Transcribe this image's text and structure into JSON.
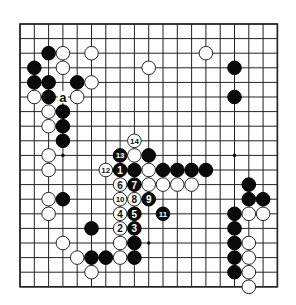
{
  "diagram": {
    "type": "go-board",
    "size": 19,
    "geometry": {
      "left": 20,
      "top": 24,
      "dx": 14.3,
      "dy": 14.6,
      "stone_radius": 6.8
    },
    "colors": {
      "background": "#ffffff",
      "line": "#222222",
      "black": "#0a0a0a",
      "white": "#ffffff"
    },
    "star_points": [
      [
        3,
        3
      ],
      [
        9,
        3
      ],
      [
        15,
        3
      ],
      [
        3,
        9
      ],
      [
        9,
        9
      ],
      [
        15,
        9
      ],
      [
        3,
        15
      ],
      [
        9,
        15
      ],
      [
        15,
        15
      ]
    ],
    "stones": [
      {
        "c": 2,
        "r": 2,
        "color": "black"
      },
      {
        "c": 3,
        "r": 2,
        "color": "white"
      },
      {
        "c": 5,
        "r": 2,
        "color": "white"
      },
      {
        "c": 13,
        "r": 2,
        "color": "white"
      },
      {
        "c": 1,
        "r": 3,
        "color": "black"
      },
      {
        "c": 3,
        "r": 3,
        "color": "white"
      },
      {
        "c": 9,
        "r": 3,
        "color": "white"
      },
      {
        "c": 15,
        "r": 3,
        "color": "black"
      },
      {
        "c": 1,
        "r": 4,
        "color": "black"
      },
      {
        "c": 2,
        "r": 4,
        "color": "black"
      },
      {
        "c": 4,
        "r": 4,
        "color": "black"
      },
      {
        "c": 5,
        "r": 4,
        "color": "white"
      },
      {
        "c": 1,
        "r": 5,
        "color": "white"
      },
      {
        "c": 2,
        "r": 5,
        "color": "black"
      },
      {
        "c": 4,
        "r": 5,
        "color": "white"
      },
      {
        "c": 15,
        "r": 5,
        "color": "black"
      },
      {
        "c": 2,
        "r": 6,
        "color": "white"
      },
      {
        "c": 3,
        "r": 6,
        "color": "black"
      },
      {
        "c": 2,
        "r": 7,
        "color": "white"
      },
      {
        "c": 3,
        "r": 7,
        "color": "black"
      },
      {
        "c": 3,
        "r": 8,
        "color": "black"
      },
      {
        "c": 2,
        "r": 9,
        "color": "white"
      },
      {
        "c": 8,
        "r": 9,
        "color": "white"
      },
      {
        "c": 9,
        "r": 9,
        "color": "black"
      },
      {
        "c": 2,
        "r": 10,
        "color": "white"
      },
      {
        "c": 8,
        "r": 10,
        "color": "black"
      },
      {
        "c": 9,
        "r": 10,
        "color": "white"
      },
      {
        "c": 10,
        "r": 10,
        "color": "black"
      },
      {
        "c": 11,
        "r": 10,
        "color": "black"
      },
      {
        "c": 12,
        "r": 10,
        "color": "black"
      },
      {
        "c": 13,
        "r": 10,
        "color": "black"
      },
      {
        "c": 9,
        "r": 11,
        "color": "white"
      },
      {
        "c": 10,
        "r": 11,
        "color": "white"
      },
      {
        "c": 11,
        "r": 11,
        "color": "white"
      },
      {
        "c": 12,
        "r": 11,
        "color": "white"
      },
      {
        "c": 16,
        "r": 11,
        "color": "black"
      },
      {
        "c": 2,
        "r": 12,
        "color": "white"
      },
      {
        "c": 3,
        "r": 12,
        "color": "black"
      },
      {
        "c": 16,
        "r": 12,
        "color": "black"
      },
      {
        "c": 17,
        "r": 12,
        "color": "black"
      },
      {
        "c": 2,
        "r": 13,
        "color": "white"
      },
      {
        "c": 15,
        "r": 13,
        "color": "black"
      },
      {
        "c": 16,
        "r": 13,
        "color": "white"
      },
      {
        "c": 17,
        "r": 13,
        "color": "white"
      },
      {
        "c": 5,
        "r": 14,
        "color": "black"
      },
      {
        "c": 15,
        "r": 14,
        "color": "black"
      },
      {
        "c": 3,
        "r": 15,
        "color": "white"
      },
      {
        "c": 7,
        "r": 15,
        "color": "white"
      },
      {
        "c": 8,
        "r": 15,
        "color": "black"
      },
      {
        "c": 15,
        "r": 15,
        "color": "black"
      },
      {
        "c": 16,
        "r": 15,
        "color": "white"
      },
      {
        "c": 4,
        "r": 16,
        "color": "white"
      },
      {
        "c": 5,
        "r": 16,
        "color": "black"
      },
      {
        "c": 6,
        "r": 16,
        "color": "black"
      },
      {
        "c": 7,
        "r": 16,
        "color": "white"
      },
      {
        "c": 8,
        "r": 16,
        "color": "black"
      },
      {
        "c": 15,
        "r": 16,
        "color": "black"
      },
      {
        "c": 16,
        "r": 16,
        "color": "white"
      },
      {
        "c": 5,
        "r": 17,
        "color": "white"
      },
      {
        "c": 15,
        "r": 17,
        "color": "black"
      },
      {
        "c": 16,
        "r": 17,
        "color": "white"
      },
      {
        "c": 16,
        "r": 18,
        "color": "white"
      }
    ],
    "moves": [
      {
        "n": "1",
        "c": 7,
        "r": 10,
        "color": "black"
      },
      {
        "n": "2",
        "c": 7,
        "r": 14,
        "color": "white"
      },
      {
        "n": "3",
        "c": 8,
        "r": 14,
        "color": "black"
      },
      {
        "n": "4",
        "c": 7,
        "r": 13,
        "color": "white"
      },
      {
        "n": "5",
        "c": 8,
        "r": 13,
        "color": "black"
      },
      {
        "n": "6",
        "c": 7,
        "r": 11,
        "color": "white"
      },
      {
        "n": "7",
        "c": 8,
        "r": 11,
        "color": "black"
      },
      {
        "n": "8",
        "c": 8,
        "r": 12,
        "color": "white"
      },
      {
        "n": "9",
        "c": 9,
        "r": 12,
        "color": "black"
      },
      {
        "n": "10",
        "c": 7,
        "r": 12,
        "color": "white"
      },
      {
        "n": "11",
        "c": 10,
        "r": 13,
        "color": "black"
      },
      {
        "n": "12",
        "c": 6,
        "r": 10,
        "color": "white"
      },
      {
        "n": "13",
        "c": 7,
        "r": 9,
        "color": "black"
      },
      {
        "n": "14",
        "c": 8,
        "r": 8,
        "color": "white"
      }
    ],
    "labels": [
      {
        "text": "a",
        "c": 3,
        "r": 5
      }
    ]
  }
}
